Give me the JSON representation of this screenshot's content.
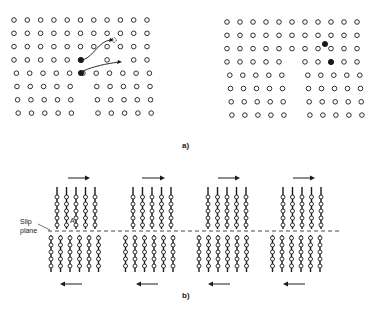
{
  "figure": {
    "panel_a": {
      "label": "a)",
      "left_lattice": {
        "cols": 11,
        "rows": 8,
        "description": "Atom lattice with vacancy and migrating atoms (filled) with arrows"
      },
      "right_lattice": {
        "cols": 11,
        "rows": 8,
        "description": "Atom lattice after atom migration with filled atoms displaced"
      }
    },
    "panel_b": {
      "label": "b)",
      "slip_plane_label": "Slip",
      "slip_plane_label2": "plane",
      "atom_label": "A",
      "stages": 4,
      "description": "Sequence of dislocation motion across slip plane under shear"
    }
  },
  "colors": {
    "ink": "#1a1a1a",
    "background": "#ffffff"
  }
}
